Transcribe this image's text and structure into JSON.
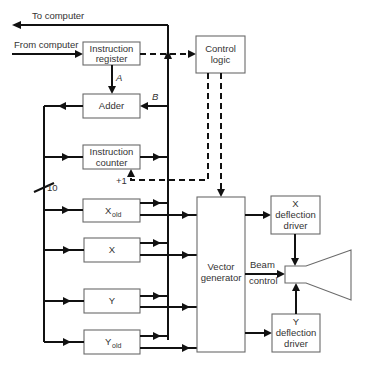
{
  "diagram": {
    "external": {
      "to_computer": "To computer",
      "from_computer": "From computer"
    },
    "blocks": {
      "instruction_register": [
        "Instruction",
        "register"
      ],
      "adder": "Adder",
      "control_logic": [
        "Control",
        "logic"
      ],
      "instruction_counter": [
        "Instruction",
        "counter"
      ],
      "x_old": {
        "main": "X",
        "sub": "old"
      },
      "x": "X",
      "y": "Y",
      "y_old": {
        "main": "Y",
        "sub": "old"
      },
      "vector_generator": [
        "Vector",
        "generator"
      ],
      "x_deflection_driver": [
        "X",
        "deflection",
        "driver"
      ],
      "y_deflection_driver": [
        "Y",
        "deflection",
        "driver"
      ]
    },
    "labels": {
      "path_a": "A",
      "path_b": "B",
      "increment": "+1",
      "bus_width": "10",
      "beam_control": [
        "Beam",
        "control"
      ]
    },
    "output_device": "CRT"
  }
}
